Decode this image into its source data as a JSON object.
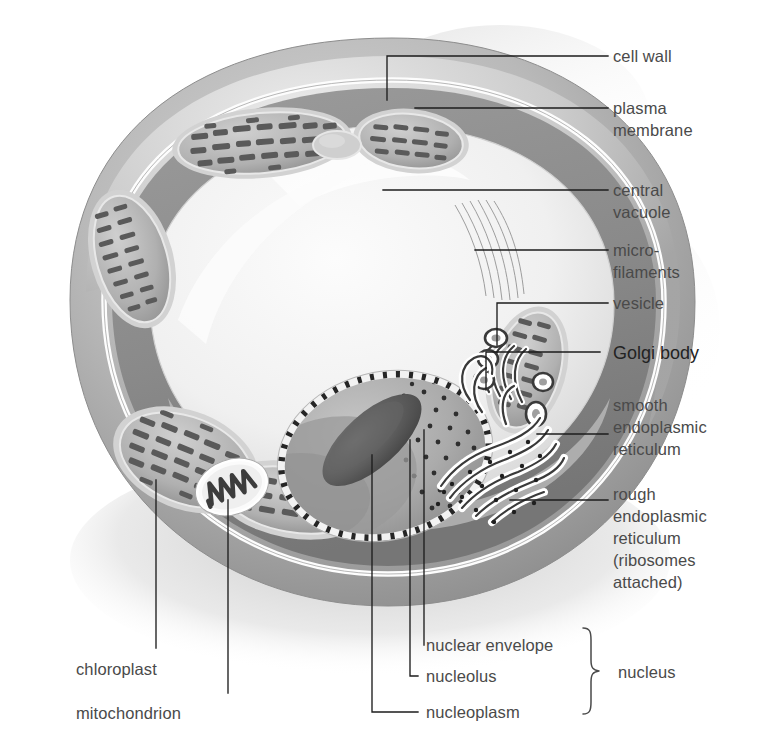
{
  "figure": {
    "background_color": "#ffffff",
    "ink_color": "#1d1d1d",
    "label_color": "#4a4a4a"
  },
  "labels": {
    "cell_wall": "cell wall",
    "plasma_membrane_l1": "plasma",
    "plasma_membrane_l2": "membrane",
    "central_vacuole_l1": "central",
    "central_vacuole_l2": "vacuole",
    "microfilaments_l1": "micro-",
    "microfilaments_l2": "filaments",
    "vesicle": "vesicle",
    "golgi_body": "Golgi  body",
    "smooth_er_l1": "smooth",
    "smooth_er_l2": "endoplasmic",
    "smooth_er_l3": "reticulum",
    "rough_er_l1": "rough",
    "rough_er_l2": "endoplasmic",
    "rough_er_l3": "reticulum",
    "rough_er_l4": "(ribosomes",
    "rough_er_l5": "attached)",
    "chloroplast": "chloroplast",
    "mitochondrion": "mitochondrion",
    "nuclear_envelope": "nuclear envelope",
    "nucleolus": "nucleolus",
    "nucleoplasm": "nucleoplasm",
    "nucleus_group": "nucleus"
  },
  "structures": [
    {
      "name": "cell-wall",
      "description": "thick outer grey wall enclosing the cell"
    },
    {
      "name": "plasma-membrane",
      "description": "thin white line just inside the cell wall"
    },
    {
      "name": "central-vacuole",
      "description": "large pale region filling the cell centre"
    },
    {
      "name": "microfilaments",
      "description": "fine strands in cytoplasm near vacuole edge"
    },
    {
      "name": "vesicle",
      "description": "small round vesicles budding from Golgi"
    },
    {
      "name": "golgi-body",
      "description": "stack of flattened curved cisternae"
    },
    {
      "name": "smooth-endoplasmic-reticulum",
      "description": "smooth tubular membranes, no ribosomes"
    },
    {
      "name": "rough-endoplasmic-reticulum",
      "description": "folded membranes studded with ribosome dots"
    },
    {
      "name": "chloroplast",
      "description": "oval organelle with internal grana stacks",
      "count": 6
    },
    {
      "name": "mitochondrion",
      "description": "oval organelle with zig-zag cristae",
      "count": 1
    },
    {
      "name": "nucleus",
      "description": "large sphere with dashed envelope, dark nucleolus, stippled nucleoplasm"
    }
  ]
}
